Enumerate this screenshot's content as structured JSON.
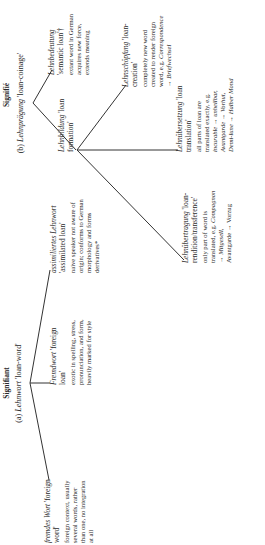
{
  "signifiant": {
    "title": "Signifiant",
    "root": {
      "label_prefix": "(a)",
      "term": "Lehnwort",
      "gloss": "'loan-word'"
    },
    "leaves": [
      {
        "term": "fremdes Wort",
        "gloss": "'foreign word'",
        "description": "foreign context, usually several words, rather than one, no integration at all"
      },
      {
        "term": "Fremdwort",
        "gloss": "'foreign loan'",
        "description": "exotic in spelling, stress, pronunciation, and form, heavily marked for style"
      },
      {
        "term": "assimiliertes Lehnwort",
        "gloss": "'assimilated loan'",
        "description": "naive speaker not aware of origin; conforms to German morphology and forms derivatives*"
      }
    ]
  },
  "signifie": {
    "title": "Signifié",
    "root": {
      "label_prefix": "(b)",
      "term": "Lehnprägung",
      "gloss": "'loan-coinage'"
    },
    "lehnbedeutung": {
      "term": "Lehnbedeutung",
      "gloss": "'semantic loan'†",
      "description": "extant word in German acquires new force, extends meaning"
    },
    "lehnbildung": {
      "term": "Lehnbildung",
      "gloss": "'loan formation'"
    },
    "lehnschoepfung": {
      "term": "Lehnschöpfung",
      "gloss": "'loan-creation'",
      "description": "completely new word created to render foreign word, e.g. ",
      "example": "Correspondence → Briefwechsel"
    },
    "lehnuebersetzung": {
      "term": "Lehnübersetzung",
      "gloss": "'loan translation'",
      "description": "all parts of loan are translated exactly, e.g.",
      "examples": [
        "incurable → unheilbar,",
        "Avantgarde → Vorhut,",
        "Demi-lune → Halber Mond"
      ]
    },
    "lehnuebertragung": {
      "term": "Lehnübertragung",
      "gloss": "'loan-rendition/transference'",
      "description": "only part of word is translated, e.g. ",
      "example1": "Compagnon → Mitgesell,",
      "example2": "Avantgarde → Vorzug"
    }
  }
}
